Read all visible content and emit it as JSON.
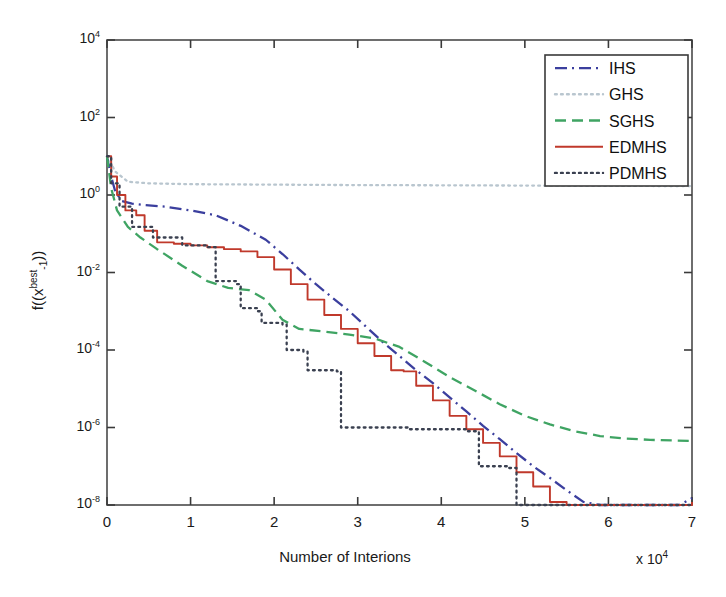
{
  "figure": {
    "kind": "line-chart",
    "background": "#ffffff"
  },
  "axes": {
    "x_label": "Number of Interions",
    "x_multiplier_prefix": "x 10",
    "x_multiplier_exp": "4",
    "y_label_parts": {
      "lead": "f((x",
      "sup": "best",
      "sub": "-1",
      "tail": "))"
    },
    "y_label_plain": "f((x^best_-1))",
    "x_ticks": [
      "0",
      "1",
      "2",
      "3",
      "4",
      "5",
      "6",
      "7"
    ],
    "y_tick_exps": [
      "4",
      "2",
      "0",
      "-2",
      "-4",
      "-6",
      "-8"
    ],
    "y_tick_mantissa": "10"
  },
  "legend": {
    "entries": [
      {
        "label": "IHS",
        "color": "#3b3f9e",
        "style": "dashdot"
      },
      {
        "label": "GHS",
        "color": "#b9c6cf",
        "style": "dotted"
      },
      {
        "label": "SGHS",
        "color": "#3fa463",
        "style": "dashed"
      },
      {
        "label": "EDMHS",
        "color": "#c0392b",
        "style": "solid"
      },
      {
        "label": "PDMHS",
        "color": "#3a4050",
        "style": "dotted"
      }
    ]
  },
  "chart_data": {
    "type": "line",
    "title": "",
    "xlabel": "Number of Interions",
    "ylabel": "f((x^best_-1))",
    "xlim": [
      0,
      7
    ],
    "ylim": [
      1e-08,
      10000.0
    ],
    "yscale": "log",
    "x_unit_scale": 10000,
    "grid": false,
    "legend_position": "top-right",
    "series": [
      {
        "name": "IHS",
        "color": "#3b3f9e",
        "style": "dashdot",
        "x": [
          0.0,
          0.05,
          0.1,
          0.18,
          0.3,
          0.45,
          0.7,
          1.0,
          1.3,
          1.6,
          1.9,
          2.1,
          2.3,
          2.5,
          2.7,
          2.9,
          3.1,
          3.3,
          3.5,
          3.7,
          3.9,
          4.1,
          4.3,
          4.5,
          4.7,
          4.9,
          5.1,
          5.3,
          5.5,
          5.7,
          5.9,
          6.1,
          6.3,
          6.5,
          6.7,
          6.85,
          7.0
        ],
        "y": [
          10.0,
          3.0,
          1.2,
          0.7,
          0.6,
          0.55,
          0.5,
          0.4,
          0.3,
          0.16,
          0.07,
          0.03,
          0.012,
          0.005,
          0.0022,
          0.001,
          0.0004,
          0.00016,
          7e-05,
          3e-05,
          1.4e-05,
          6e-06,
          2.6e-06,
          1.1e-06,
          5e-07,
          2.2e-07,
          1e-07,
          5e-08,
          2.4e-08,
          1.2e-08,
          6e-09,
          2.8e-09,
          1.1e-09,
          4e-10,
          1e-10,
          2.5e-11,
          1.5e-08
        ]
      },
      {
        "name": "GHS",
        "color": "#b9c6cf",
        "style": "dotted",
        "x": [
          0.0,
          0.1,
          0.25,
          0.5,
          1.0,
          2.0,
          3.0,
          4.0,
          5.0,
          6.0,
          7.0
        ],
        "y": [
          10.0,
          4.0,
          2.2,
          2.0,
          1.9,
          1.85,
          1.8,
          1.78,
          1.75,
          1.72,
          1.7
        ]
      },
      {
        "name": "SGHS",
        "color": "#3fa463",
        "style": "dashed",
        "x": [
          0.0,
          0.05,
          0.12,
          0.25,
          0.4,
          0.6,
          0.9,
          1.2,
          1.45,
          1.7,
          1.9,
          2.1,
          2.3,
          2.6,
          2.9,
          3.2,
          3.5,
          3.8,
          4.1,
          4.4,
          4.7,
          5.0,
          5.3,
          5.6,
          5.9,
          6.2,
          6.5,
          6.8,
          7.0
        ],
        "y": [
          10.0,
          1.5,
          0.4,
          0.15,
          0.08,
          0.04,
          0.015,
          0.006,
          0.004,
          0.0035,
          0.002,
          0.0006,
          0.00035,
          0.0003,
          0.00025,
          0.0002,
          0.00012,
          5e-05,
          2e-05,
          9e-06,
          4e-06,
          2e-06,
          1.2e-06,
          8e-07,
          6e-07,
          5.2e-07,
          4.8e-07,
          4.6e-07,
          4.5e-07
        ]
      },
      {
        "name": "EDMHS",
        "color": "#c0392b",
        "style": "solid",
        "x": [
          0.0,
          0.05,
          0.12,
          0.22,
          0.35,
          0.45,
          0.6,
          0.8,
          1.0,
          1.2,
          1.4,
          1.6,
          1.8,
          2.0,
          2.2,
          2.4,
          2.6,
          2.8,
          3.0,
          3.2,
          3.4,
          3.55,
          3.7,
          3.9,
          4.1,
          4.3,
          4.5,
          4.7,
          4.9,
          5.1,
          5.3,
          5.5,
          5.7,
          5.9,
          6.1,
          6.3,
          6.5,
          6.7,
          6.85,
          7.0
        ],
        "y": [
          10.0,
          3.0,
          1.0,
          0.4,
          0.3,
          0.12,
          0.06,
          0.055,
          0.05,
          0.045,
          0.04,
          0.035,
          0.025,
          0.012,
          0.005,
          0.002,
          0.0008,
          0.00035,
          0.00015,
          7e-05,
          3e-05,
          2.8e-05,
          1.2e-05,
          5e-06,
          2e-06,
          9e-07,
          4e-07,
          1.8e-07,
          7e-08,
          3e-08,
          1.2e-08,
          5e-09,
          2e-09,
          9e-10,
          3.5e-10,
          1.4e-10,
          5e-11,
          1.6e-11,
          5e-12,
          1.2e-08
        ]
      },
      {
        "name": "PDMHS",
        "color": "#3a4050",
        "style": "dotted",
        "x": [
          0.0,
          0.05,
          0.15,
          0.3,
          0.55,
          0.9,
          1.2,
          1.25,
          1.3,
          1.55,
          1.6,
          1.8,
          1.85,
          2.1,
          2.15,
          2.35,
          2.4,
          2.75,
          2.8,
          2.85,
          3.6,
          4.3,
          4.4,
          4.45,
          4.8,
          4.85,
          4.9,
          5.55,
          5.6,
          5.65,
          6.4,
          7.0
        ],
        "y": [
          10.0,
          2.0,
          0.5,
          0.15,
          0.08,
          0.05,
          0.045,
          0.045,
          0.006,
          0.005,
          0.0012,
          0.001,
          0.0005,
          0.00045,
          0.0001,
          9e-05,
          3e-05,
          2.8e-05,
          1e-06,
          1e-06,
          9e-07,
          8e-07,
          8e-07,
          1e-07,
          9e-08,
          9e-08,
          2e-09,
          1.8e-09,
          1.8e-09,
          2e-11,
          1.8e-11,
          1.6e-11
        ]
      }
    ]
  }
}
